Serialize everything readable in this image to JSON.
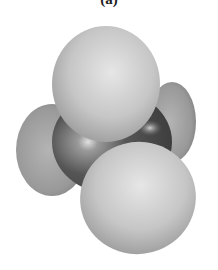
{
  "figure": {
    "label": "(a)",
    "atoms": [
      {
        "id": "carbon",
        "element": "C",
        "role": "central"
      },
      {
        "id": "h-top",
        "element": "H"
      },
      {
        "id": "h-left",
        "element": "H"
      },
      {
        "id": "h-right-back",
        "element": "H"
      },
      {
        "id": "h-front",
        "element": "H"
      }
    ],
    "colors": {
      "hydrogen": "#c8c8c8",
      "hydrogen_shadow": "#8a8a8a",
      "carbon": "#5a5a5a",
      "carbon_highlight": "#d8d8d8",
      "background": "#ffffff"
    }
  }
}
